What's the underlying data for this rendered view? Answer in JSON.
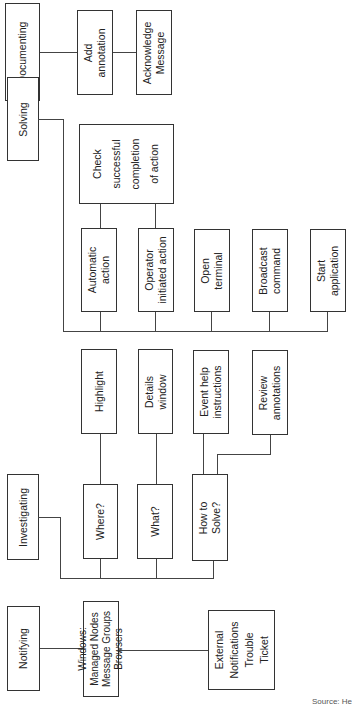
{
  "diagram": {
    "stages": {
      "documenting": "Documenting",
      "solving": "Solving",
      "investigating": "Investigating",
      "notifying": "Notifying"
    },
    "documenting_items": {
      "add_annotation": "Add\nannotation",
      "acknowledge_message": "Acknowledge\nMessage"
    },
    "solving_items": {
      "check_completion": "Check\nsuccessful\ncompletion\nof action",
      "automatic_action": "Automatic\naction",
      "operator_action": "Operator\ninitiated action",
      "open_terminal": "Open\nterminal",
      "broadcast_command": "Broadcast\ncommand",
      "start_application": "Start\napplication"
    },
    "investigating_items": {
      "highlight": "Highlight",
      "details_window": "Details\nwindow",
      "event_help": "Event help\ninstructions",
      "review_annotations": "Review\nannotations",
      "where": "Where?",
      "what": "What?",
      "how_to_solve": "How to\nSolve?"
    },
    "notifying_items": {
      "windows": "Windows:\nManaged Nodes\nMessage Groups\nBrowsers",
      "external": "External\nNotifications\nTrouble\nTicket"
    },
    "source": "Source: He"
  }
}
